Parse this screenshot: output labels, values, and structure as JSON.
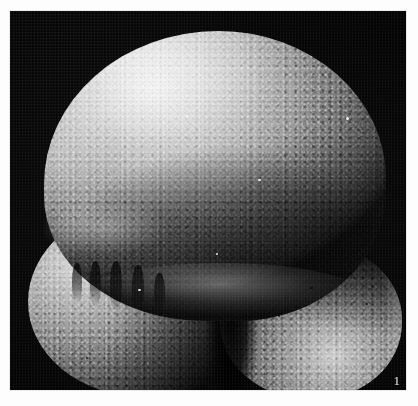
{
  "figure": {
    "number_label": "1",
    "caption": ""
  },
  "micrograph": {
    "imaging_mode": "scanning electron micrograph",
    "background_color": "#000000",
    "page_color": "#ffffff",
    "highlight_color": "#efefef",
    "midtone_color": "#9e9e9e",
    "shadow_color": "#101010",
    "label_color": "#e8e8e8",
    "frame": {
      "left": 10,
      "top": 11,
      "width": 396,
      "height": 379
    },
    "subject": {
      "name": "foraminifera-test",
      "description": "planktonic foraminifer test in umbilical view",
      "surface_texture": "granular pustulose"
    },
    "parts": [
      {
        "id": "chamber-final",
        "label": "final chamber"
      },
      {
        "id": "chamber-lower-left",
        "label": "penultimate chamber"
      },
      {
        "id": "chamber-lower-right",
        "label": "antepenultimate chamber"
      },
      {
        "id": "aperture-shadow",
        "label": "umbilical aperture"
      },
      {
        "id": "suture-left",
        "label": "suture"
      }
    ]
  }
}
